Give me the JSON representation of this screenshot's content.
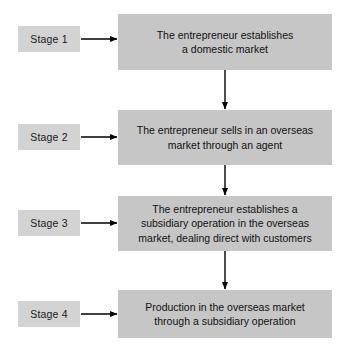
{
  "diagram": {
    "colors": {
      "content_box_fill": "#c6c6c6",
      "stage_box_fill": "#d3d3d3",
      "arrow": "#000000",
      "background": "#ffffff",
      "text": "#111111"
    },
    "stages": [
      {
        "stage_label": "Stage 1",
        "content": "The entrepreneur establishes\na domestic market"
      },
      {
        "stage_label": "Stage 2",
        "content": "The entrepreneur sells in an overseas\nmarket through an agent"
      },
      {
        "stage_label": "Stage 3",
        "content": "The entrepreneur establishes a\nsubsidiary operation in the overseas\nmarket, dealing direct with customers"
      },
      {
        "stage_label": "Stage 4",
        "content": "Production in the overseas market\nthrough a subsidiary operation"
      }
    ],
    "connectors": {
      "horizontal_arrow_count": 4,
      "vertical_arrow_count": 3,
      "direction": "downward"
    }
  }
}
